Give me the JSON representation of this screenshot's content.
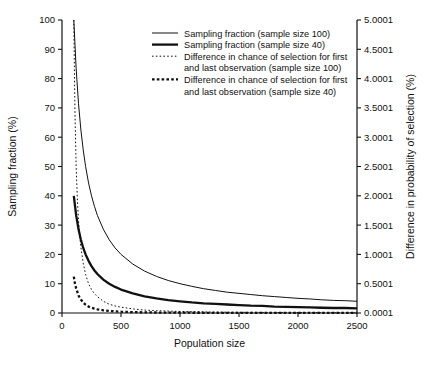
{
  "chart_data": {
    "type": "line",
    "title": "",
    "xlabel": "Population size",
    "ylabel": "Sampling fraction (%)",
    "y2label": "Difference in probability of selection (%)",
    "xlim": [
      0,
      2500
    ],
    "ylim": [
      0,
      100
    ],
    "y2lim": [
      0.0001,
      5.0001
    ],
    "xticks": [
      0,
      500,
      1000,
      1500,
      2000,
      2500
    ],
    "xticklabels": [
      "0",
      "500",
      "1000",
      "1500",
      "2000",
      "2500"
    ],
    "yticks": [
      0,
      10,
      20,
      30,
      40,
      50,
      60,
      70,
      80,
      90,
      100
    ],
    "yticklabels": [
      "0",
      "10",
      "20",
      "30",
      "40",
      "50",
      "60",
      "70",
      "80",
      "90",
      "100"
    ],
    "y2ticks": [
      0.0001,
      0.5001,
      1.0001,
      1.5001,
      2.0001,
      2.5001,
      3.0001,
      3.5001,
      4.0001,
      4.5001,
      5.0001
    ],
    "y2ticklabels": [
      "0.0001",
      "0.5001",
      "1.0001",
      "1.5001",
      "2.0001",
      "2.5001",
      "3.0001",
      "3.5001",
      "4.0001",
      "4.5001",
      "5.0001"
    ],
    "grid": false,
    "legend_position": "upper right",
    "series": [
      {
        "name": "Sampling fraction (sample size 100)",
        "axis": "left",
        "style": "solid",
        "width": "thin",
        "color": "#111111",
        "x": [
          100,
          120,
          140,
          160,
          180,
          200,
          225,
          250,
          275,
          300,
          350,
          400,
          450,
          500,
          600,
          700,
          800,
          900,
          1000,
          1100,
          1200,
          1300,
          1400,
          1500,
          1600,
          1700,
          1800,
          1900,
          2000,
          2100,
          2200,
          2300,
          2400,
          2500
        ],
        "y": [
          100,
          83.3,
          71.4,
          62.5,
          55.6,
          50,
          44.4,
          40,
          36.4,
          33.3,
          28.6,
          25,
          22.2,
          20,
          16.7,
          14.3,
          12.5,
          11.1,
          10,
          9.1,
          8.3,
          7.7,
          7.1,
          6.7,
          6.3,
          5.9,
          5.6,
          5.3,
          5,
          4.8,
          4.5,
          4.3,
          4.2,
          4
        ]
      },
      {
        "name": "Sampling fraction (sample size 40)",
        "axis": "left",
        "style": "solid",
        "width": "thick",
        "color": "#111111",
        "x": [
          100,
          120,
          140,
          160,
          180,
          200,
          225,
          250,
          275,
          300,
          350,
          400,
          450,
          500,
          600,
          700,
          800,
          900,
          1000,
          1100,
          1200,
          1300,
          1400,
          1500,
          1600,
          1700,
          1800,
          1900,
          2000,
          2100,
          2200,
          2300,
          2400,
          2500
        ],
        "y": [
          40,
          33.3,
          28.6,
          25,
          22.2,
          20,
          17.8,
          16,
          14.5,
          13.3,
          11.4,
          10,
          8.9,
          8,
          6.7,
          5.7,
          5,
          4.4,
          4,
          3.6,
          3.3,
          3.1,
          2.9,
          2.7,
          2.5,
          2.4,
          2.2,
          2.1,
          2,
          1.9,
          1.8,
          1.7,
          1.7,
          1.6
        ]
      },
      {
        "name": "Difference in chance of selection for first and last observation (sample size 100)",
        "axis": "right",
        "style": "dotted",
        "width": "thin",
        "color": "#111111",
        "x": [
          100,
          110,
          120,
          130,
          140,
          150,
          160,
          180,
          200,
          225,
          250,
          275,
          300,
          350,
          400,
          450,
          500,
          600,
          700,
          800,
          1000,
          1250,
          1500,
          2000,
          2500
        ],
        "y": [
          5.0001,
          3.4,
          2.5,
          1.95,
          1.58,
          1.32,
          1.12,
          0.85,
          0.66,
          0.5,
          0.4,
          0.33,
          0.28,
          0.2,
          0.15,
          0.12,
          0.1,
          0.07,
          0.05,
          0.04,
          0.026,
          0.017,
          0.012,
          0.0065,
          0.0042
        ]
      },
      {
        "name": "Difference in chance of selection for first and last observation (sample size 40)",
        "axis": "right",
        "style": "dotted",
        "width": "thick",
        "color": "#111111",
        "x": [
          100,
          110,
          120,
          130,
          140,
          150,
          160,
          180,
          200,
          225,
          250,
          275,
          300,
          350,
          400,
          450,
          500,
          600,
          700,
          800,
          1000,
          1250,
          1500,
          2000,
          2500
        ],
        "y": [
          0.62,
          0.5,
          0.42,
          0.36,
          0.3,
          0.26,
          0.23,
          0.18,
          0.14,
          0.11,
          0.09,
          0.075,
          0.063,
          0.046,
          0.035,
          0.028,
          0.022,
          0.015,
          0.011,
          0.0085,
          0.0055,
          0.0035,
          0.0025,
          0.0015,
          0.001
        ]
      }
    ],
    "legend_entries": [
      {
        "label": "Sampling fraction (sample size 100)",
        "style": "solid",
        "width": "thin",
        "lines": [
          "Sampling fraction (sample size 100)"
        ]
      },
      {
        "label": "Sampling fraction (sample size 40)",
        "style": "solid",
        "width": "thick",
        "lines": [
          "Sampling fraction (sample size 40)"
        ]
      },
      {
        "label": "Difference in chance of selection for first and last observation (sample size 100)",
        "style": "dotted",
        "width": "thin",
        "lines": [
          "Difference in chance of selection for first",
          "and last observation (sample size 100)"
        ]
      },
      {
        "label": "Difference in chance of selection for first and last observation (sample size 40)",
        "style": "dotted",
        "width": "thick",
        "lines": [
          "Difference in chance of selection for first",
          "and last observation (sample size 40)"
        ]
      }
    ]
  }
}
